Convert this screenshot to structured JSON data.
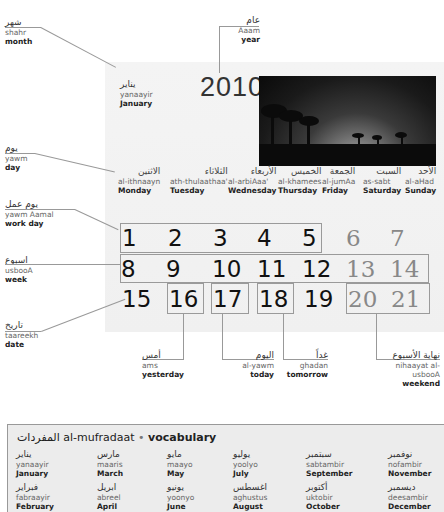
{
  "labels": {
    "month": {
      "arabic": "شهر",
      "translit": "shahr",
      "english": "month"
    },
    "year": {
      "arabic": "عام",
      "translit": "Aaam",
      "english": "year"
    },
    "january": {
      "arabic": "يناير",
      "translit": "yanaayir",
      "english": "January"
    },
    "day": {
      "arabic": "يوم",
      "translit": "yawm",
      "english": "day"
    },
    "work_day": {
      "arabic": "يوم عمل",
      "translit": "yawm Aamal",
      "english": "work day"
    },
    "week": {
      "arabic": "اسبوع",
      "translit": "usbooA",
      "english": "week"
    },
    "date": {
      "arabic": "تاريخ",
      "translit": "taareekh",
      "english": "date"
    },
    "yesterday": {
      "arabic": "أمس",
      "translit": "ams",
      "english": "yesterday"
    },
    "today": {
      "arabic": "اليوم",
      "translit": "al-yawm",
      "english": "today"
    },
    "tomorrow": {
      "arabic": "غداً",
      "translit": "ghadan",
      "english": "tomorrow"
    },
    "weekend": {
      "arabic": "نهاية الأسبوع",
      "translit": "nihaayat al-usbooA",
      "english": "weekend"
    }
  },
  "calendar": {
    "year": "2010",
    "photo_icon": "palm-sunset-photo",
    "weekdays": [
      {
        "arabic": "الاثنين",
        "translit": "al-ithnaayn",
        "english": "Monday"
      },
      {
        "arabic": "الثلاثاء",
        "translit": "ath-thulaathaa'",
        "english": "Tuesday"
      },
      {
        "arabic": "الأربعاء",
        "translit": "al-arbiAaa'",
        "english": "Wednesday"
      },
      {
        "arabic": "الخميس",
        "translit": "al-khamees",
        "english": "Thursday"
      },
      {
        "arabic": "الجمعة",
        "translit": "al-jumAa",
        "english": "Friday"
      },
      {
        "arabic": "السبت",
        "translit": "as-sabt",
        "english": "Saturday"
      },
      {
        "arabic": "الأحد",
        "translit": "al-aHad",
        "english": "Sunday"
      }
    ],
    "weeks": [
      [
        "1",
        "2",
        "3",
        "4",
        "5",
        "6",
        "7"
      ],
      [
        "8",
        "9",
        "10",
        "11",
        "12",
        "13",
        "14"
      ],
      [
        "15",
        "16",
        "17",
        "18",
        "19",
        "20",
        "21"
      ]
    ]
  },
  "vocab": {
    "title_arabic": "المفردات",
    "title_translit": "al-mufradaat",
    "separator": "•",
    "title_english": "vocabulary",
    "items": [
      {
        "arabic": "يناير",
        "translit": "yanaayir",
        "english": "January"
      },
      {
        "arabic": "فبراير",
        "translit": "fabraayir",
        "english": "February"
      },
      {
        "arabic": "مارس",
        "translit": "maaris",
        "english": "March"
      },
      {
        "arabic": "ابريل",
        "translit": "abreel",
        "english": "April"
      },
      {
        "arabic": "مايو",
        "translit": "maayo",
        "english": "May"
      },
      {
        "arabic": "يونيو",
        "translit": "yoonyo",
        "english": "June"
      },
      {
        "arabic": "يوليو",
        "translit": "yoolyo",
        "english": "July"
      },
      {
        "arabic": "اغسطس",
        "translit": "aghustus",
        "english": "August"
      },
      {
        "arabic": "سبتمبر",
        "translit": "sabtambir",
        "english": "September"
      },
      {
        "arabic": "أكتوبر",
        "translit": "uktobir",
        "english": "October"
      },
      {
        "arabic": "نوفمبر",
        "translit": "nofambir",
        "english": "November"
      },
      {
        "arabic": "ديسمبر",
        "translit": "deesambir",
        "english": "December"
      }
    ]
  }
}
